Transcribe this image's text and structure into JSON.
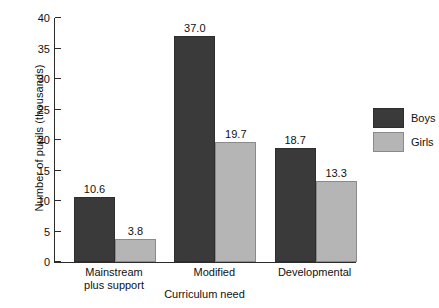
{
  "chart_data": {
    "type": "bar",
    "title": "",
    "xlabel": "Curriculum need",
    "ylabel": "Number of pupils (thousands)",
    "categories": [
      "Mainstream plus support",
      "Modified",
      "Developmental"
    ],
    "category_label_lines": [
      [
        "Mainstream",
        "plus support"
      ],
      [
        "Modified"
      ],
      [
        "Developmental"
      ]
    ],
    "series": [
      {
        "name": "Boys",
        "color": "#3a3a3a",
        "values": [
          10.6,
          37.0,
          18.7
        ],
        "value_labels": [
          "10.6",
          "37.0",
          "18.7"
        ]
      },
      {
        "name": "Girls",
        "color": "#b5b5b5",
        "values": [
          3.8,
          19.7,
          13.3
        ],
        "value_labels": [
          "3.8",
          "19.7",
          "13.3"
        ]
      }
    ],
    "ylim": [
      0,
      40
    ],
    "yticks": [
      0,
      5,
      10,
      15,
      20,
      25,
      30,
      35,
      40
    ],
    "ytick_labels": [
      "0",
      "5",
      "10",
      "15",
      "20",
      "25",
      "30",
      "35",
      "40"
    ],
    "grid": false,
    "legend_position": "right",
    "axis_color": "#2b2b2b"
  },
  "legend": {
    "entries": [
      {
        "label": "Boys"
      },
      {
        "label": "Girls"
      }
    ]
  }
}
